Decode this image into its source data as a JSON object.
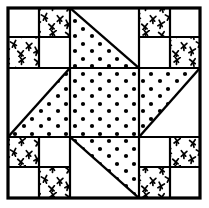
{
  "figure": {
    "kind": "quilt-block-line-drawing",
    "background_color": "#ffffff",
    "ink_color": "#000000",
    "canvas": {
      "width": 209,
      "height": 208
    }
  },
  "frame": {
    "name": "outer-border",
    "x": 8,
    "y": 8,
    "width": 192,
    "height": 190,
    "stroke_color": "#000000",
    "stroke_width": 3.2
  },
  "grid": {
    "columns": 3,
    "rows": 3,
    "x_lines": [
      8,
      70,
      139,
      200
    ],
    "y_lines": [
      8,
      68,
      137,
      198
    ],
    "stroke_color": "#000000",
    "stroke_width": 2.2
  },
  "textures": {
    "dot": {
      "name": "dot-fill",
      "label": "Dotted print fabric",
      "dot_color": "#000000",
      "dot_radius": 2.1,
      "spacing_x": 17,
      "spacing_y": 15,
      "stagger": true
    },
    "cross": {
      "name": "cross-fill",
      "label": "X / bird-track print fabric",
      "mark_color": "#000000",
      "stroke_width": 1.7,
      "mark_size": 6,
      "spacing_x": 16,
      "spacing_y": 14
    },
    "plain": {
      "name": "plain-fill",
      "label": "Plain white fabric",
      "fill_color": "#ffffff"
    }
  },
  "blocks": [
    {
      "name": "corner-top-left",
      "type": "four-patch",
      "position": "top-left",
      "x": 8,
      "y": 8,
      "width": 62,
      "height": 60,
      "patches": [
        {
          "name": "patch-tl",
          "quadrant": "top-left",
          "fill": "plain"
        },
        {
          "name": "patch-tr",
          "quadrant": "top-right",
          "fill": "cross"
        },
        {
          "name": "patch-bl",
          "quadrant": "bottom-left",
          "fill": "cross"
        },
        {
          "name": "patch-br",
          "quadrant": "bottom-right",
          "fill": "plain"
        }
      ]
    },
    {
      "name": "corner-top-right",
      "type": "four-patch",
      "position": "top-right",
      "x": 139,
      "y": 8,
      "width": 61,
      "height": 60,
      "patches": [
        {
          "name": "patch-tl",
          "quadrant": "top-left",
          "fill": "cross"
        },
        {
          "name": "patch-tr",
          "quadrant": "top-right",
          "fill": "plain"
        },
        {
          "name": "patch-bl",
          "quadrant": "bottom-left",
          "fill": "plain"
        },
        {
          "name": "patch-br",
          "quadrant": "bottom-right",
          "fill": "cross"
        }
      ]
    },
    {
      "name": "corner-bottom-left",
      "type": "four-patch",
      "position": "bottom-left",
      "x": 8,
      "y": 137,
      "width": 62,
      "height": 61,
      "patches": [
        {
          "name": "patch-tl",
          "quadrant": "top-left",
          "fill": "cross"
        },
        {
          "name": "patch-tr",
          "quadrant": "top-right",
          "fill": "plain"
        },
        {
          "name": "patch-bl",
          "quadrant": "bottom-left",
          "fill": "plain"
        },
        {
          "name": "patch-br",
          "quadrant": "bottom-right",
          "fill": "cross"
        }
      ]
    },
    {
      "name": "corner-bottom-right",
      "type": "four-patch",
      "position": "bottom-right",
      "x": 139,
      "y": 137,
      "width": 61,
      "height": 61,
      "patches": [
        {
          "name": "patch-tl",
          "quadrant": "top-left",
          "fill": "plain"
        },
        {
          "name": "patch-tr",
          "quadrant": "top-right",
          "fill": "cross"
        },
        {
          "name": "patch-bl",
          "quadrant": "bottom-left",
          "fill": "cross"
        },
        {
          "name": "patch-br",
          "quadrant": "bottom-right",
          "fill": "plain"
        }
      ]
    },
    {
      "name": "edge-top-center",
      "type": "half-square-triangle",
      "position": "top-center",
      "x": 70,
      "y": 8,
      "width": 69,
      "height": 60,
      "diagonal": "tl-br",
      "triangles": [
        {
          "name": "triangle-lower-left",
          "fill": "dot"
        },
        {
          "name": "triangle-upper-right",
          "fill": "plain"
        }
      ]
    },
    {
      "name": "edge-middle-left",
      "type": "half-square-triangle",
      "position": "middle-left",
      "x": 8,
      "y": 68,
      "width": 62,
      "height": 69,
      "diagonal": "bl-tr",
      "triangles": [
        {
          "name": "triangle-lower-right",
          "fill": "dot"
        },
        {
          "name": "triangle-upper-left",
          "fill": "plain"
        }
      ]
    },
    {
      "name": "edge-middle-right",
      "type": "half-square-triangle",
      "position": "middle-right",
      "x": 139,
      "y": 68,
      "width": 61,
      "height": 69,
      "diagonal": "bl-tr",
      "triangles": [
        {
          "name": "triangle-upper-left",
          "fill": "dot"
        },
        {
          "name": "triangle-lower-right",
          "fill": "plain"
        }
      ]
    },
    {
      "name": "edge-bottom-center",
      "type": "half-square-triangle",
      "position": "bottom-center",
      "x": 70,
      "y": 137,
      "width": 69,
      "height": 61,
      "diagonal": "tl-br",
      "triangles": [
        {
          "name": "triangle-upper-right",
          "fill": "dot"
        },
        {
          "name": "triangle-lower-left",
          "fill": "plain"
        }
      ]
    },
    {
      "name": "center-square",
      "type": "solid-square",
      "position": "center",
      "x": 70,
      "y": 68,
      "width": 69,
      "height": 69,
      "fill": "dot"
    }
  ]
}
